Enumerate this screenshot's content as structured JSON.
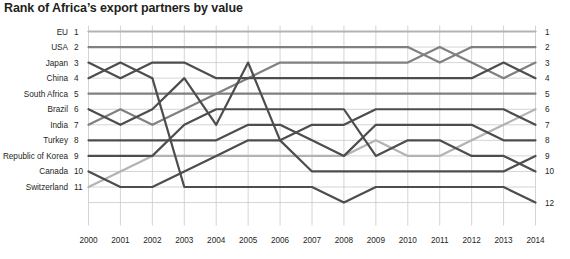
{
  "chart_data": {
    "type": "line",
    "title": "Rank of Africa’s export partners by value",
    "xlabel": "",
    "ylabel": "",
    "grid": true,
    "legend": "none",
    "y_inverted": true,
    "ylim": [
      1,
      12
    ],
    "x": [
      2000,
      2001,
      2002,
      2003,
      2004,
      2005,
      2006,
      2007,
      2008,
      2009,
      2010,
      2011,
      2012,
      2013,
      2014
    ],
    "categories": [
      "2000",
      "2001",
      "2002",
      "2003",
      "2004",
      "2005",
      "2006",
      "2007",
      "2008",
      "2009",
      "2010",
      "2011",
      "2012",
      "2013",
      "2014"
    ],
    "left_axis_labels": [
      {
        "name": "EU",
        "rank": "1"
      },
      {
        "name": "USA",
        "rank": "2"
      },
      {
        "name": "Japan",
        "rank": "3"
      },
      {
        "name": "China",
        "rank": "4"
      },
      {
        "name": "South Africa",
        "rank": "5"
      },
      {
        "name": "Brazil",
        "rank": "6"
      },
      {
        "name": "India",
        "rank": "7"
      },
      {
        "name": "Turkey",
        "rank": "8"
      },
      {
        "name": "Republic of Korea",
        "rank": "9"
      },
      {
        "name": "Canada",
        "rank": "10"
      },
      {
        "name": "Switzerland",
        "rank": "11"
      }
    ],
    "right_axis_labels": [
      "1",
      "2",
      "3",
      "4",
      "5",
      "6",
      "7",
      "8",
      "9",
      "10",
      "12"
    ],
    "right_axis_values": [
      1,
      2,
      3,
      4,
      5,
      6,
      7,
      8,
      9,
      10,
      12
    ],
    "series": [
      {
        "name": "EU",
        "color": "#b3b3b3",
        "values": [
          1,
          1,
          1,
          1,
          1,
          1,
          1,
          1,
          1,
          1,
          1,
          1,
          1,
          1,
          1
        ]
      },
      {
        "name": "USA",
        "color": "#808080",
        "values": [
          2,
          2,
          2,
          2,
          2,
          2,
          2,
          2,
          2,
          2,
          2,
          3,
          2,
          2,
          2
        ]
      },
      {
        "name": "China",
        "color": "#808080",
        "values": [
          7,
          6,
          7,
          6,
          5,
          4,
          3,
          3,
          3,
          3,
          3,
          2,
          3,
          4,
          3
        ]
      },
      {
        "name": "Japan",
        "color": "#4d4d4d",
        "values": [
          3,
          4,
          3,
          3,
          4,
          4,
          4,
          4,
          4,
          4,
          4,
          4,
          4,
          3,
          4
        ]
      },
      {
        "name": "South Africa",
        "color": "#808080",
        "values": [
          5,
          5,
          5,
          5,
          5,
          5,
          5,
          5,
          5,
          5,
          5,
          5,
          5,
          5,
          5
        ]
      },
      {
        "name": "Brazil",
        "color": "#b3b3b3",
        "values": [
          11,
          10,
          9,
          9,
          9,
          9,
          9,
          9,
          9,
          8,
          9,
          9,
          8,
          7,
          6
        ]
      },
      {
        "name": "India",
        "color": "#4d4d4d",
        "values": [
          10,
          11,
          11,
          10,
          9,
          8,
          8,
          7,
          7,
          6,
          6,
          6,
          6,
          6,
          7
        ]
      },
      {
        "name": "Turkey",
        "color": "#4d4d4d",
        "values": [
          8,
          8,
          8,
          8,
          8,
          7,
          7,
          8,
          9,
          7,
          7,
          7,
          7,
          8,
          8
        ]
      },
      {
        "name": "Republic of Korea",
        "color": "#4d4d4d",
        "values": [
          9,
          9,
          9,
          7,
          6,
          6,
          6,
          6,
          6,
          9,
          8,
          8,
          9,
          9,
          10
        ]
      },
      {
        "name": "Canada",
        "color": "#4d4d4d",
        "values": [
          6,
          7,
          6,
          4,
          7,
          3,
          8,
          10,
          10,
          10,
          10,
          10,
          10,
          10,
          9
        ]
      },
      {
        "name": "Switzerland",
        "color": "#4d4d4d",
        "values": [
          4,
          3,
          4,
          11,
          11,
          11,
          11,
          11,
          12,
          11,
          11,
          11,
          11,
          11,
          12
        ]
      }
    ]
  }
}
